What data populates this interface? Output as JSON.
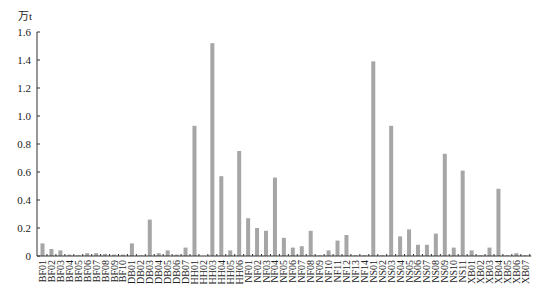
{
  "chart_data": {
    "type": "bar",
    "title": "",
    "xlabel": "",
    "ylabel": "万t",
    "ylim": [
      0,
      1.6
    ],
    "yticks": [
      "0",
      "0.2",
      "0.4",
      "0.6",
      "0.8",
      "1.0",
      "1.2",
      "1.4",
      "1.6"
    ],
    "grid": false,
    "legend": "none",
    "bar_color": "#a6a6a6",
    "categories": [
      "BF01",
      "BF02",
      "BF03",
      "BF04",
      "BF05",
      "BF06",
      "BF07",
      "BF08",
      "BF09",
      "BF10",
      "DB01",
      "DB02",
      "DB03",
      "DB04",
      "DB05",
      "DB06",
      "DB07",
      "HH01",
      "HH02",
      "HH03",
      "HH04",
      "HH05",
      "HH06",
      "NF01",
      "NF02",
      "NF03",
      "NF04",
      "NF05",
      "NF06",
      "NF07",
      "NF08",
      "NF09",
      "NF10",
      "NF11",
      "NF12",
      "NF13",
      "NF14",
      "NS01",
      "NS02",
      "NS03",
      "NS04",
      "NS05",
      "NS06",
      "NS07",
      "NS08",
      "NS09",
      "NS10",
      "NS11",
      "XB01",
      "XB02",
      "XB03",
      "XB04",
      "XB05",
      "XB06",
      "XB07"
    ],
    "values": [
      0.09,
      0.05,
      0.04,
      0.01,
      0.005,
      0.02,
      0.02,
      0.015,
      0.01,
      0.01,
      0.09,
      0.005,
      0.26,
      0.02,
      0.04,
      0.01,
      0.06,
      0.93,
      0.0,
      1.52,
      0.57,
      0.04,
      0.75,
      0.27,
      0.2,
      0.18,
      0.56,
      0.13,
      0.06,
      0.07,
      0.18,
      0.005,
      0.04,
      0.11,
      0.15,
      0.005,
      0.005,
      1.39,
      0.005,
      0.93,
      0.14,
      0.19,
      0.08,
      0.08,
      0.16,
      0.73,
      0.06,
      0.61,
      0.04,
      0.005,
      0.06,
      0.48,
      0.005,
      0.02,
      0.005
    ]
  }
}
